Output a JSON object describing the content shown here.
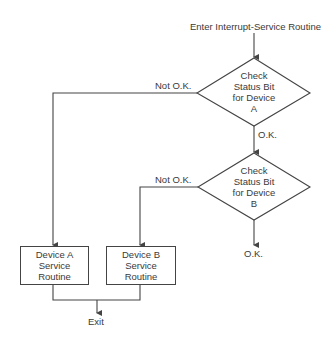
{
  "flowchart": {
    "start_label": "Enter Interrupt-Service Routine",
    "decision_a": {
      "lines": [
        "Check",
        "Status Bit",
        "for Device",
        "A"
      ],
      "no_label": "Not O.K.",
      "yes_label": "O.K."
    },
    "decision_b": {
      "lines": [
        "Check",
        "Status Bit",
        "for Device",
        "B"
      ],
      "no_label": "Not O.K.",
      "yes_label": "O.K."
    },
    "process_a": {
      "lines": [
        "Device A",
        "Service",
        "Routine"
      ]
    },
    "process_b": {
      "lines": [
        "Device B",
        "Service",
        "Routine"
      ]
    },
    "exit_label": "Exit"
  },
  "colors": {
    "line": "#444444",
    "text": "#3a3a3a",
    "background": "#ffffff"
  }
}
